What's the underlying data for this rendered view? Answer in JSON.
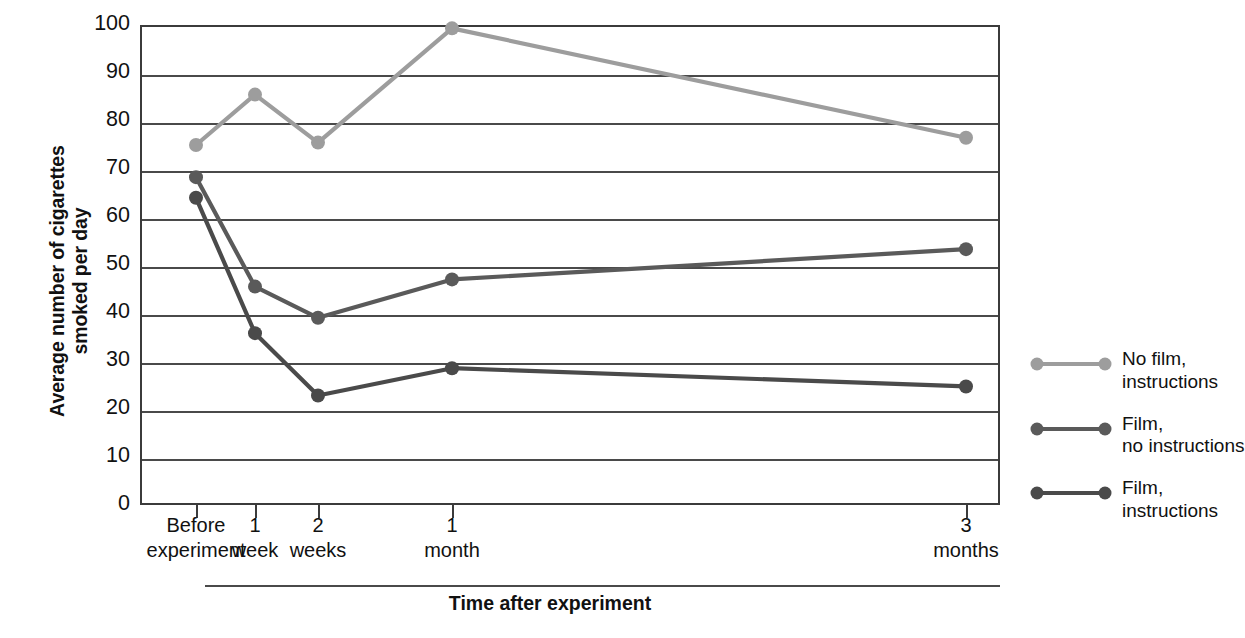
{
  "chart_data": {
    "type": "line",
    "title": "",
    "xlabel": "Time after experiment",
    "ylabel": "Average number of cigarettes\nsmoked per day",
    "categories": [
      "Before\nexperiment",
      "1\nweek",
      "2\nweeks",
      "1\nmonth",
      "3\nmonths"
    ],
    "category_labels_flat": [
      "Before experiment",
      "1 week",
      "2 weeks",
      "1 month",
      "3 months"
    ],
    "ylim": [
      0,
      100
    ],
    "yticks": [
      0,
      10,
      20,
      30,
      40,
      50,
      60,
      70,
      80,
      90,
      100
    ],
    "grid": true,
    "legend_position": "right",
    "series": [
      {
        "name": "No film,\ninstructions",
        "name_flat": "No film, instructions",
        "color": "#9d9d9d",
        "values": [
          75,
          85.5,
          75.5,
          99.3,
          76.5
        ]
      },
      {
        "name": "Film,\nno instructions",
        "name_flat": "Film, no instructions",
        "color": "#5a5a5a",
        "values": [
          68.3,
          45.5,
          39,
          47,
          53.3
        ]
      },
      {
        "name": "Film,\ninstructions",
        "name_flat": "Film, instructions",
        "color": "#4a4a4a",
        "values": [
          64,
          35.8,
          22.8,
          28.5,
          24.7
        ]
      }
    ]
  },
  "axis": {
    "y_title": "Average number of cigarettes\nsmoked per day",
    "x_title": "Time after experiment",
    "y_tick_labels": [
      "100",
      "90",
      "80",
      "70",
      "60",
      "50",
      "40",
      "30",
      "20",
      "10",
      "0"
    ],
    "x_tick_labels": [
      "Before\nexperiment",
      "1\nweek",
      "2\nweeks",
      "1\nmonth",
      "3\nmonths"
    ]
  },
  "legend": {
    "items": [
      {
        "label": "No film,\ninstructions",
        "color": "#9d9d9d"
      },
      {
        "label": "Film,\nno instructions",
        "color": "#5a5a5a"
      },
      {
        "label": "Film,\ninstructions",
        "color": "#4a4a4a"
      }
    ]
  },
  "colors": {
    "axis": "#3b3b3b",
    "grid": "#4a4a4a",
    "series_light": "#9d9d9d",
    "series_mid": "#5a5a5a",
    "series_dark": "#4a4a4a",
    "text": "#111111",
    "background": "#ffffff"
  }
}
